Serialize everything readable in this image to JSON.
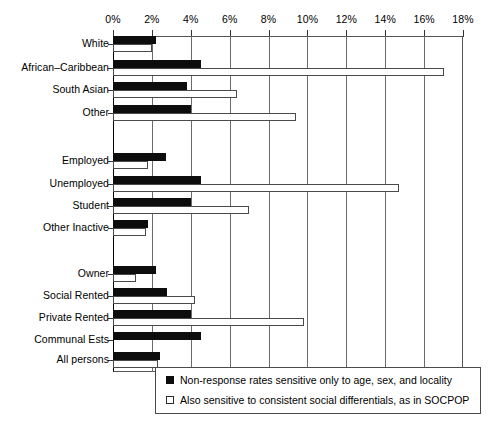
{
  "chart_data": {
    "type": "bar",
    "orientation": "horizontal",
    "title": "",
    "xlabel": "",
    "ylabel": "",
    "xlim": [
      0,
      18
    ],
    "xunit": "%",
    "grid": true,
    "legend_position": "bottom-right",
    "tick_labels": [
      "0%",
      "2%",
      "4%",
      "6%",
      "8%",
      "10%",
      "12%",
      "14%",
      "16%",
      "18%"
    ],
    "tick_values": [
      0,
      2,
      4,
      6,
      8,
      10,
      12,
      14,
      16,
      18
    ],
    "categories": [
      "White",
      "African–Caribbean",
      "South Asian",
      "Other",
      "Employed",
      "Unemployed",
      "Student",
      "Other Inactive",
      "Owner",
      "Social Rented",
      "Private Rented",
      "Communal Ests",
      "All persons"
    ],
    "series": [
      {
        "name": "Non-response rates sensitive only to age, sex, and locality",
        "style": "filled-black",
        "color": "#0d0d0d",
        "values": [
          2.2,
          4.5,
          3.8,
          4.0,
          2.7,
          4.5,
          4.0,
          1.8,
          2.2,
          2.8,
          4.0,
          4.5,
          2.4
        ]
      },
      {
        "name": "Also sensitive to consistent social differentials, as in SOCPOP",
        "style": "open-white",
        "color": "#ffffff",
        "values": [
          2.0,
          17.0,
          6.4,
          9.4,
          1.8,
          14.7,
          7.0,
          1.7,
          1.2,
          4.2,
          9.8,
          null,
          2.3
        ]
      }
    ],
    "groups": [
      {
        "name": "ethnicity",
        "categories": [
          "White",
          "African–Caribbean",
          "South Asian",
          "Other"
        ]
      },
      {
        "name": "economic-activity",
        "categories": [
          "Employed",
          "Unemployed",
          "Student",
          "Other Inactive"
        ]
      },
      {
        "name": "tenure",
        "categories": [
          "Owner",
          "Social Rented",
          "Private Rented",
          "Communal Ests"
        ]
      },
      {
        "name": "total",
        "categories": [
          "All persons"
        ]
      }
    ]
  },
  "legend": {
    "items": [
      {
        "swatch": "dark",
        "label": "Non-response rates sensitive only to age, sex, and locality"
      },
      {
        "swatch": "light",
        "label": "Also sensitive to consistent social differentials, as in SOCPOP"
      }
    ]
  }
}
